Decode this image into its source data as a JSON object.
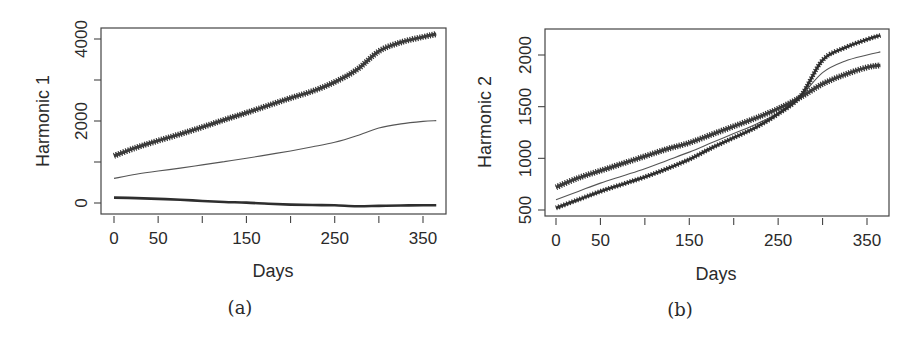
{
  "figures": [
    {
      "caption": "(a)",
      "xlabel": "Days",
      "ylabel": "Harmonic 1"
    },
    {
      "caption": "(b)",
      "xlabel": "Days",
      "ylabel": "Harmonic 2"
    }
  ],
  "chart_data": [
    {
      "type": "line",
      "panel": "(a)",
      "title": "",
      "xlabel": "Days",
      "ylabel": "Harmonic 1",
      "xlim": [
        0,
        365
      ],
      "ylim": [
        -200,
        4300
      ],
      "x_ticks": [
        0,
        50,
        100,
        150,
        200,
        250,
        300,
        350
      ],
      "x_tick_labels": [
        "0",
        "50",
        "",
        "150",
        "",
        "250",
        "",
        "350"
      ],
      "y_ticks": [
        0,
        1000,
        2000,
        3000,
        4000
      ],
      "y_tick_labels": [
        "0",
        "",
        "2000",
        "",
        "4000"
      ],
      "grid": false,
      "legend": null,
      "x": [
        0,
        25,
        50,
        75,
        100,
        125,
        150,
        175,
        200,
        225,
        250,
        275,
        300,
        325,
        350,
        365
      ],
      "series": [
        {
          "name": "upper (star markers)",
          "style": "thick-star",
          "values": [
            1150,
            1350,
            1520,
            1680,
            1850,
            2030,
            2200,
            2380,
            2560,
            2730,
            2950,
            3250,
            3700,
            3920,
            4050,
            4120
          ]
        },
        {
          "name": "middle (thin line)",
          "style": "thin-line",
          "values": [
            600,
            700,
            780,
            850,
            930,
            1010,
            1090,
            1180,
            1270,
            1370,
            1480,
            1640,
            1830,
            1930,
            1990,
            2010
          ]
        },
        {
          "name": "lower (thick line)",
          "style": "thick-line",
          "values": [
            130,
            120,
            100,
            80,
            50,
            25,
            10,
            -20,
            -40,
            -50,
            -55,
            -80,
            -70,
            -60,
            -55,
            -55
          ]
        }
      ]
    },
    {
      "type": "line",
      "panel": "(b)",
      "title": "",
      "xlabel": "Days",
      "ylabel": "Harmonic 2",
      "xlim": [
        0,
        365
      ],
      "ylim": [
        460,
        2230
      ],
      "x_ticks": [
        0,
        50,
        100,
        150,
        200,
        250,
        300,
        350
      ],
      "x_tick_labels": [
        "0",
        "50",
        "",
        "150",
        "",
        "250",
        "",
        "350"
      ],
      "y_ticks": [
        500,
        1000,
        1500,
        2000
      ],
      "y_tick_labels": [
        "500",
        "1000",
        "1500",
        "2000"
      ],
      "grid": false,
      "legend": null,
      "x": [
        0,
        25,
        50,
        75,
        100,
        125,
        150,
        175,
        200,
        225,
        250,
        275,
        300,
        325,
        350,
        365
      ],
      "series": [
        {
          "name": "star markers (ends lower)",
          "style": "thick-star",
          "values": [
            720,
            810,
            880,
            950,
            1020,
            1090,
            1150,
            1230,
            1310,
            1390,
            1480,
            1590,
            1720,
            1810,
            1880,
            1900
          ]
        },
        {
          "name": "thin line",
          "style": "thin-line",
          "values": [
            600,
            680,
            760,
            830,
            900,
            980,
            1060,
            1150,
            1240,
            1330,
            1440,
            1600,
            1830,
            1940,
            2000,
            2030
          ]
        },
        {
          "name": "dashed-thick (ends highest)",
          "style": "thick-line",
          "values": [
            520,
            600,
            680,
            750,
            820,
            900,
            990,
            1100,
            1200,
            1300,
            1430,
            1600,
            1950,
            2070,
            2150,
            2190
          ]
        }
      ]
    }
  ]
}
